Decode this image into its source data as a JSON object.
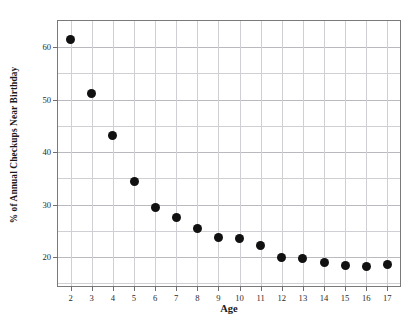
{
  "chart_data": {
    "type": "scatter",
    "title": "",
    "xlabel": "Age",
    "ylabel": "% of Annual Checkups Near Birthday",
    "categories": [
      2,
      3,
      4,
      5,
      6,
      7,
      8,
      9,
      10,
      11,
      12,
      13,
      14,
      15,
      16,
      17
    ],
    "x": [
      2,
      3,
      4,
      5,
      6,
      7,
      8,
      9,
      10,
      11,
      12,
      13,
      14,
      15,
      16,
      17
    ],
    "values": [
      61.5,
      51.2,
      43.2,
      34.5,
      29.5,
      27.6,
      25.4,
      23.8,
      23.5,
      22.3,
      20.0,
      19.7,
      18.9,
      18.5,
      18.3,
      18.6
    ],
    "series": [
      {
        "name": "% of Annual Checkups Near Birthday",
        "values": [
          61.5,
          51.2,
          43.2,
          34.5,
          29.5,
          27.6,
          25.4,
          23.8,
          23.5,
          22.3,
          20.0,
          19.7,
          18.9,
          18.5,
          18.3,
          18.6
        ],
        "marker": "filled-circle",
        "color": "#111111"
      }
    ],
    "xlim": [
      1.4,
      17.6
    ],
    "ylim": [
      14.5,
      65.0
    ],
    "xticks": [
      2,
      3,
      4,
      5,
      6,
      7,
      8,
      9,
      10,
      11,
      12,
      13,
      14,
      15,
      16,
      17
    ],
    "xticklabels": [
      "2",
      "3",
      "4",
      "5",
      "6",
      "7",
      "8",
      "9",
      "10",
      "11",
      "12",
      "13",
      "14",
      "15",
      "16",
      "17"
    ],
    "yticks": [
      20,
      30,
      40,
      50,
      60
    ],
    "yticklabels": [
      "20",
      "30",
      "40",
      "50",
      "60"
    ],
    "y_minor_ticks": [
      15,
      25,
      35,
      45,
      55,
      65
    ],
    "grid": true,
    "grid_axes": "both",
    "legend": false,
    "legend_position": "none",
    "colors": {
      "marker": "#111111",
      "grid": "#cfcfd4",
      "grid_major": "#b9b9bf",
      "frame": "#7a7a7a",
      "background": "#ffffff",
      "text": "#1a1a1a"
    }
  }
}
